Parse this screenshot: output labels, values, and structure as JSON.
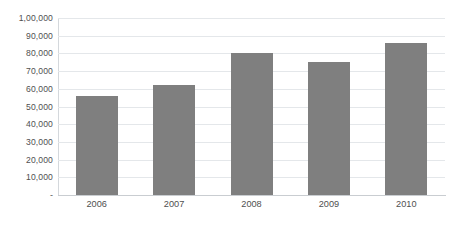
{
  "chart_data": {
    "type": "bar",
    "title": "",
    "subtitle": "",
    "xlabel": "",
    "ylabel": "",
    "categories": [
      "2006",
      "2007",
      "2008",
      "2009",
      "2010"
    ],
    "values": [
      56000,
      62000,
      80000,
      75000,
      86000
    ],
    "series": [
      {
        "name": "",
        "color": "#7f7f7f",
        "values": [
          56000,
          62000,
          80000,
          75000,
          86000
        ]
      }
    ],
    "ylim": [
      0,
      100000
    ],
    "y_ticks": [
      0,
      10000,
      20000,
      30000,
      40000,
      50000,
      60000,
      70000,
      80000,
      90000,
      100000
    ],
    "y_tick_labels": [
      "-",
      "10,000",
      "20,000",
      "30,000",
      "40,000",
      "50,000",
      "60,000",
      "70,000",
      "80,000",
      "90,000",
      "1,00,000"
    ],
    "grid": true,
    "grid_color": "#e4e7ea",
    "legend": false,
    "legend_position": "none",
    "background_color": "#ffffff",
    "axis_color": "#c9cdd1",
    "tick_label_color": "#4f4f4f",
    "annotations": []
  }
}
